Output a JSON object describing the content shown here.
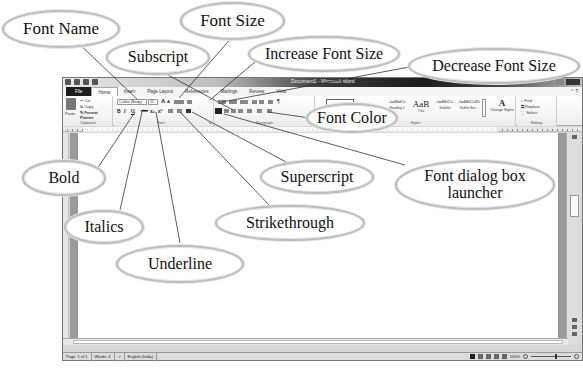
{
  "window": {
    "title": "Document1 - Microsoft Word",
    "tabs": [
      "File",
      "Home",
      "Insert",
      "Page Layout",
      "References",
      "Mailings",
      "Review",
      "View"
    ],
    "active_tab": "Home"
  },
  "ribbon": {
    "clipboard": {
      "paste": "Paste",
      "cut": "Cut",
      "copy": "Copy",
      "format_painter": "Format Painter",
      "label": "Clipboard"
    },
    "font": {
      "font_name": "Calibri (Body)",
      "font_size": "11",
      "bold": "B",
      "italic": "I",
      "underline": "U",
      "strikethrough": "abc",
      "subscript": "x₂",
      "superscript": "x²",
      "grow": "A",
      "shrink": "A",
      "label": "Font"
    },
    "paragraph": {
      "label": "Paragraph",
      "pilcrow": "¶"
    },
    "styles": {
      "items": [
        {
          "sample": "AaBbCc",
          "name": "Heading 2"
        },
        {
          "sample": "AaB",
          "name": "Title"
        },
        {
          "sample": "AaBbCc.",
          "name": "Subtitle"
        },
        {
          "sample": "AaBbCcDı",
          "name": "Subtle Em..."
        }
      ],
      "change_styles": "Change Styles",
      "label": "Styles"
    },
    "editing": {
      "find": "Find",
      "replace": "Replace",
      "select": "Select",
      "label": "Editing"
    }
  },
  "status_bar": {
    "page": "Page: 1 of 1",
    "words": "Words: 4",
    "language": "English (India)",
    "zoom": "100%"
  },
  "callouts": {
    "font_name": "Font Name",
    "font_size": "Font Size",
    "subscript": "Subscript",
    "increase_font_size": "Increase Font Size",
    "decrease_font_size": "Decrease Font Size",
    "font_color": "Font Color",
    "bold": "Bold",
    "superscript": "Superscript",
    "font_dialog_line1": "Font dialog box",
    "font_dialog_line2": "launcher",
    "italics": "Italics",
    "strikethrough": "Strikethrough",
    "underline": "Underline"
  }
}
